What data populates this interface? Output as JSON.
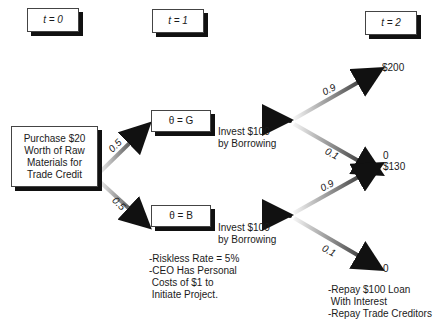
{
  "time_headers": [
    {
      "label": "t = 0"
    },
    {
      "label": "t = 1"
    },
    {
      "label": "t = 2"
    }
  ],
  "root": {
    "text": "Purchase $20\nWorth of Raw\nMaterials for\nTrade Credit"
  },
  "states": [
    {
      "label": "θ = G",
      "prob": "0.5"
    },
    {
      "label": "θ = B",
      "prob": "0.5"
    }
  ],
  "actions": [
    {
      "text": "Invest $100\nby Borrowing"
    },
    {
      "text": "Invest $100\nby Borrowing"
    }
  ],
  "outcomes": {
    "good": [
      {
        "prob": "0.9",
        "payoff": "$200"
      },
      {
        "prob": "0.1",
        "payoff": "0"
      }
    ],
    "bad": [
      {
        "prob": "0.9",
        "payoff": "$130"
      },
      {
        "prob": "0.1",
        "payoff": "0"
      }
    ]
  },
  "notes": {
    "assumptions": "-Riskless Rate = 5%\n-CEO Has Personal\n Costs of $1 to\n Initiate Project.",
    "repayment": "-Repay $100 Loan\n With Interest\n-Repay Trade Creditors"
  },
  "colors": {
    "arrow_dark": "#111111",
    "arrow_light": "#f5f5f5",
    "shadow": "#111111"
  }
}
